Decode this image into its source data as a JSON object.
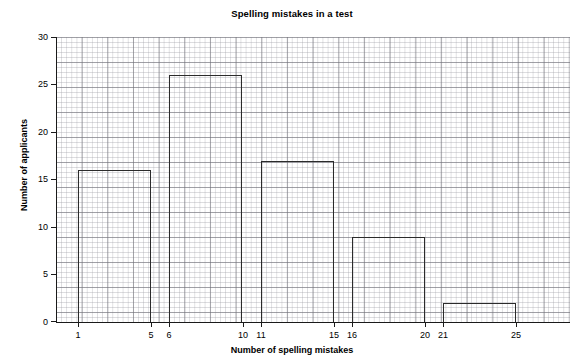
{
  "chart_data": {
    "type": "bar",
    "title": "Spelling mistakes in a test",
    "xlabel": "Number of spelling mistakes",
    "ylabel": "Number of applicants",
    "categories": [
      "1 - 5",
      "6 - 10",
      "11 - 15",
      "16 - 20",
      "21 - 25"
    ],
    "bin_edges": [
      [
        1,
        5
      ],
      [
        6,
        10
      ],
      [
        11,
        15
      ],
      [
        16,
        20
      ],
      [
        21,
        25
      ]
    ],
    "values": [
      16,
      26,
      17,
      9,
      2
    ],
    "xlim": [
      1,
      25
    ],
    "ylim": [
      0,
      30
    ],
    "ytick_labels": [
      "0",
      "5",
      "10",
      "15",
      "20",
      "25",
      "30"
    ],
    "ytick_values": [
      0,
      5,
      10,
      15,
      20,
      25,
      30
    ],
    "xtick_labels": [
      "1",
      "5",
      "6",
      "10",
      "11",
      "15",
      "16",
      "20",
      "21",
      "25"
    ],
    "xtick_values": [
      1,
      5,
      6,
      10,
      11,
      15,
      16,
      20,
      21,
      25
    ],
    "grid": true,
    "legend": "none",
    "bar_style": "outline",
    "colors": {
      "bar_outline": "#2b2b2b",
      "bar_fill": "none",
      "grid_major": "#6e6e76",
      "grid_minor": "#96969e",
      "axis": "#1a1a1a",
      "text": "#000000",
      "background": "#ffffff"
    }
  }
}
